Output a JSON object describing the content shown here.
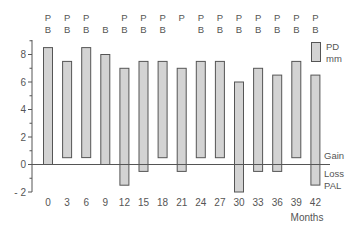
{
  "chart_data": {
    "type": "bar",
    "subtype": "floating-range",
    "title": "",
    "xlabel": "Months",
    "ylabel": "",
    "ylim": [
      -2,
      9
    ],
    "yticks": [
      -2,
      0,
      2,
      4,
      6,
      8
    ],
    "grid": false,
    "categories": [
      "0",
      "3",
      "6",
      "9",
      "12",
      "15",
      "18",
      "21",
      "24",
      "27",
      "30",
      "33",
      "36",
      "39",
      "42"
    ],
    "series": [
      {
        "name": "PD mm",
        "top": [
          8.5,
          7.5,
          8.5,
          8.0,
          7.0,
          7.5,
          7.5,
          7.0,
          7.5,
          7.5,
          6.0,
          7.0,
          6.5,
          7.5,
          6.5
        ],
        "bottom": [
          0.0,
          0.5,
          0.5,
          0.0,
          -1.5,
          -0.5,
          0.5,
          -0.5,
          0.5,
          0.5,
          -2.0,
          -0.5,
          -0.5,
          0.5,
          -1.5
        ]
      }
    ],
    "top_annotations": [
      {
        "month": "0",
        "p": "P",
        "b": "B"
      },
      {
        "month": "3",
        "p": "P",
        "b": "B"
      },
      {
        "month": "6",
        "p": "P",
        "b": "B"
      },
      {
        "month": "9",
        "p": "",
        "b": "B"
      },
      {
        "month": "12",
        "p": "P",
        "b": "B"
      },
      {
        "month": "15",
        "p": "P",
        "b": "B"
      },
      {
        "month": "18",
        "p": "P",
        "b": "B"
      },
      {
        "month": "21",
        "p": "P",
        "b": ""
      },
      {
        "month": "24",
        "p": "P",
        "b": "B"
      },
      {
        "month": "27",
        "p": "P",
        "b": "B"
      },
      {
        "month": "30",
        "p": "P",
        "b": "B"
      },
      {
        "month": "33",
        "p": "P",
        "b": "B"
      },
      {
        "month": "36",
        "p": "P",
        "b": "B"
      },
      {
        "month": "39",
        "p": "P",
        "b": "B"
      },
      {
        "month": "42",
        "p": "P",
        "b": "B"
      }
    ],
    "legend": {
      "position": "top-right",
      "entries": [
        {
          "label_line1": "PD",
          "label_line2": "mm"
        }
      ]
    },
    "right_annotations": {
      "gain": "Gain",
      "loss": "Loss",
      "pal": "PAL"
    },
    "colors": {
      "bar_fill": "#d3d3d3",
      "bar_stroke": "#555555",
      "axis": "#555555",
      "text": "#555555"
    }
  }
}
